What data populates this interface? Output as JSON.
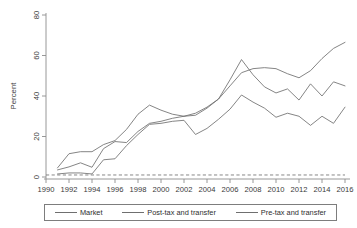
{
  "chart_data": {
    "type": "line",
    "title": "",
    "xlabel": "",
    "ylabel": "Percent",
    "xlim": [
      1990,
      2016
    ],
    "ylim": [
      0,
      80
    ],
    "xticks": [
      1990,
      1992,
      1994,
      1996,
      1998,
      2000,
      2002,
      2004,
      2006,
      2008,
      2010,
      2012,
      2014,
      2016
    ],
    "yticks": [
      0,
      20,
      40,
      60,
      80
    ],
    "grid": false,
    "legend_position": "bottom",
    "x": [
      1991,
      1992,
      1993,
      1994,
      1995,
      1996,
      1997,
      1998,
      1999,
      2000,
      2001,
      2002,
      2003,
      2004,
      2005,
      2006,
      2007,
      2008,
      2009,
      2010,
      2011,
      2012,
      2013,
      2014,
      2015,
      2016
    ],
    "series": [
      {
        "name": "Market",
        "values": [
          3.5,
          5.0,
          7.0,
          4.8,
          14.0,
          17.5,
          17.0,
          22.5,
          26.5,
          27.5,
          29.0,
          30.0,
          31.5,
          34.5,
          38.5,
          45.0,
          51.5,
          53.5,
          54.0,
          53.5,
          51.0,
          49.0,
          52.5,
          58.5,
          63.5,
          66.5
        ]
      },
      {
        "name": "Post-tax and transfer",
        "values": [
          1.5,
          2.0,
          2.0,
          1.5,
          8.5,
          9.0,
          15.5,
          21.0,
          26.0,
          26.5,
          27.5,
          28.0,
          21.0,
          24.0,
          28.5,
          33.5,
          40.5,
          37.0,
          34.0,
          29.5,
          31.5,
          30.0,
          25.5,
          30.0,
          26.5,
          34.5
        ]
      },
      {
        "name": "Pre-tax and transfer",
        "values": [
          4.5,
          11.5,
          12.5,
          12.5,
          16.0,
          18.0,
          23.5,
          31.0,
          35.5,
          33.0,
          31.0,
          30.0,
          30.5,
          34.0,
          38.5,
          48.0,
          58.0,
          50.5,
          44.5,
          41.5,
          43.5,
          38.0,
          46.0,
          40.0,
          47.0,
          45.0
        ]
      }
    ],
    "reference_line": {
      "name": "zero-reference",
      "value": 1,
      "style": "dashed"
    }
  },
  "legend": {
    "items": [
      {
        "label": "Market"
      },
      {
        "label": "Post-tax and transfer"
      },
      {
        "label": "Pre-tax and transfer"
      }
    ]
  }
}
